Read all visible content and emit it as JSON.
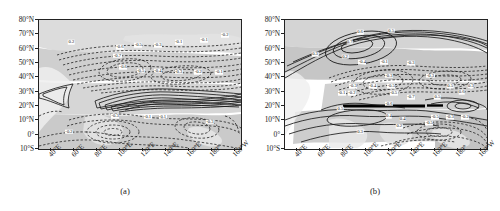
{
  "figure": {
    "type": "contour-map-pair",
    "background": "#ffffff",
    "land_shade_light": "#e2e2e2",
    "land_shade_mid": "#c9c9c9",
    "land_shade_dark": "#b4b4b4",
    "contour_positive_color": "#1a1a1a",
    "contour_negative_color": "#1a1a1a",
    "contour_positive_style": "solid",
    "contour_negative_style": "dashed"
  },
  "axes": {
    "ylabels": [
      "80°N",
      "70°N",
      "60°N",
      "50°N",
      "40°N",
      "30°N",
      "20°N",
      "10°N",
      "0°",
      "10°S"
    ],
    "yvalues": [
      80,
      70,
      60,
      50,
      40,
      30,
      20,
      10,
      0,
      -10
    ],
    "ylim": [
      -10,
      80
    ],
    "xlabels": [
      "40°E",
      "60°E",
      "80°E",
      "100°E",
      "120°E",
      "140°E",
      "160°E",
      "180°",
      "160°W"
    ],
    "xvalues": [
      40,
      60,
      80,
      100,
      120,
      140,
      160,
      180,
      200
    ],
    "xlim": [
      30,
      205
    ]
  },
  "panels": [
    {
      "id": "a",
      "caption": "(a)",
      "contour_labels": [
        {
          "text": "0.2",
          "x": 58,
          "y": 64.5
        },
        {
          "text": "-0.2",
          "x": 191,
          "y": 69.5
        },
        {
          "text": "-0.1",
          "x": 173,
          "y": 66
        },
        {
          "text": "-0.1",
          "x": 151,
          "y": 64.5
        },
        {
          "text": "-0.3",
          "x": 133,
          "y": 62.5
        },
        {
          "text": "-0.5",
          "x": 116,
          "y": 62.5
        },
        {
          "text": "-0.6",
          "x": 100,
          "y": 61
        },
        {
          "text": "-0.7",
          "x": 98,
          "y": 55
        },
        {
          "text": "-0.6",
          "x": 103,
          "y": 47
        },
        {
          "text": "-0.5",
          "x": 118,
          "y": 44.5
        },
        {
          "text": "-0.4",
          "x": 133,
          "y": 44.5
        },
        {
          "text": "-0.3",
          "x": 151,
          "y": 44
        },
        {
          "text": "-0.2",
          "x": 168,
          "y": 43.5
        },
        {
          "text": "-0.1",
          "x": 186,
          "y": 43.5
        },
        {
          "text": "-0.2",
          "x": 56,
          "y": 2
        },
        {
          "text": "-0.3",
          "x": 96,
          "y": 13
        },
        {
          "text": "-0.1",
          "x": 124,
          "y": 12.5
        },
        {
          "text": "-0.1",
          "x": 137,
          "y": 12.5
        },
        {
          "text": "-0.3",
          "x": 178,
          "y": 9
        }
      ]
    },
    {
      "id": "b",
      "caption": "(b)",
      "contour_labels": [
        {
          "text": "0.6",
          "x": 95,
          "y": 71.5
        },
        {
          "text": "0.5",
          "x": 122,
          "y": 72.5
        },
        {
          "text": "0.7",
          "x": 86,
          "y": 65
        },
        {
          "text": "0.3",
          "x": 56,
          "y": 56
        },
        {
          "text": "0.2",
          "x": 82,
          "y": 54.5
        },
        {
          "text": "-0.4",
          "x": 97,
          "y": 50.5
        },
        {
          "text": "-0.1",
          "x": 116,
          "y": 50.5
        },
        {
          "text": "-0.3",
          "x": 139,
          "y": 50
        },
        {
          "text": "-0.3",
          "x": 120,
          "y": 41
        },
        {
          "text": "-0.3",
          "x": 156,
          "y": 41
        },
        {
          "text": "-0.3",
          "x": 89,
          "y": 34
        },
        {
          "text": "-0.4",
          "x": 106,
          "y": 34
        },
        {
          "text": "-0.5",
          "x": 122,
          "y": 34
        },
        {
          "text": "0.5",
          "x": 173,
          "y": 34
        },
        {
          "text": "0.3",
          "x": 191,
          "y": 34
        },
        {
          "text": "-0.1",
          "x": 79,
          "y": 29
        },
        {
          "text": "-0.2",
          "x": 88,
          "y": 29
        },
        {
          "text": "-0.5",
          "x": 124,
          "y": 29
        },
        {
          "text": "0.6",
          "x": 183,
          "y": 29.5
        },
        {
          "text": "-0.7",
          "x": 139,
          "y": 26
        },
        {
          "text": "0.5",
          "x": 162,
          "y": 26
        },
        {
          "text": "-0.6",
          "x": 120,
          "y": 21.5
        },
        {
          "text": "0.5",
          "x": 78,
          "y": 18
        },
        {
          "text": "0.4",
          "x": 120,
          "y": 13
        },
        {
          "text": "0.4",
          "x": 132,
          "y": 11
        },
        {
          "text": "-0.5",
          "x": 160,
          "y": 12
        },
        {
          "text": "-0.3",
          "x": 173,
          "y": 12
        },
        {
          "text": "-0.2",
          "x": 186,
          "y": 12
        },
        {
          "text": "-0.5",
          "x": 155,
          "y": 8
        },
        {
          "text": "0.2",
          "x": 129,
          "y": 6
        },
        {
          "text": "0.3",
          "x": 95,
          "y": 2
        }
      ]
    }
  ]
}
